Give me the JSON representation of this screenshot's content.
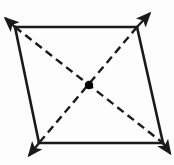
{
  "figure": {
    "type": "geometry-diagram",
    "canvas": {
      "width": 174,
      "height": 165,
      "background": "#fdfdfd"
    },
    "colors": {
      "stroke": "#1a1a1a",
      "dashed_stroke": "#1a1a1a",
      "center_point": "#000000",
      "background": "#fdfdfd"
    },
    "vertices": [
      {
        "name": "top-left",
        "x": 15,
        "y": 27
      },
      {
        "name": "top-right",
        "x": 137,
        "y": 27
      },
      {
        "name": "bottom-right",
        "x": 163,
        "y": 143
      },
      {
        "name": "bottom-left",
        "x": 39,
        "y": 143
      }
    ],
    "sides": [
      {
        "name": "top-side",
        "x1": 15,
        "y1": 27,
        "x2": 137,
        "y2": 27,
        "style": "solid",
        "width": 2.6
      },
      {
        "name": "right-side",
        "x1": 137,
        "y1": 27,
        "x2": 163,
        "y2": 143,
        "style": "solid",
        "width": 2.6
      },
      {
        "name": "bottom-side",
        "x1": 163,
        "y1": 143,
        "x2": 39,
        "y2": 143,
        "style": "solid",
        "width": 2.6
      },
      {
        "name": "left-side",
        "x1": 39,
        "y1": 143,
        "x2": 15,
        "y2": 27,
        "style": "solid",
        "width": 2.6
      }
    ],
    "diagonals": [
      {
        "name": "diagonal-tl-br",
        "x1": 15,
        "y1": 27,
        "x2": 163,
        "y2": 143,
        "style": "dashed",
        "dash": "8 5",
        "width": 2.4
      },
      {
        "name": "diagonal-tr-bl",
        "x1": 137,
        "y1": 27,
        "x2": 39,
        "y2": 143,
        "style": "dashed",
        "dash": "8 5",
        "width": 2.4
      }
    ],
    "center_point": {
      "name": "intersection-point",
      "x": 89,
      "y": 85,
      "radius": 4.2
    },
    "arrows": [
      {
        "name": "arrow-top-left",
        "x1": 15,
        "y1": 27,
        "x2": 3,
        "y2": 16,
        "direction": "up-left"
      },
      {
        "name": "arrow-top-right",
        "x1": 137,
        "y1": 27,
        "x2": 152,
        "y2": 11,
        "direction": "up-right"
      },
      {
        "name": "arrow-bottom-left",
        "x1": 39,
        "y1": 143,
        "x2": 27,
        "y2": 158,
        "direction": "down-left"
      },
      {
        "name": "arrow-bottom-right",
        "x1": 163,
        "y1": 143,
        "x2": 172,
        "y2": 156,
        "direction": "down-right"
      }
    ],
    "labels": []
  }
}
